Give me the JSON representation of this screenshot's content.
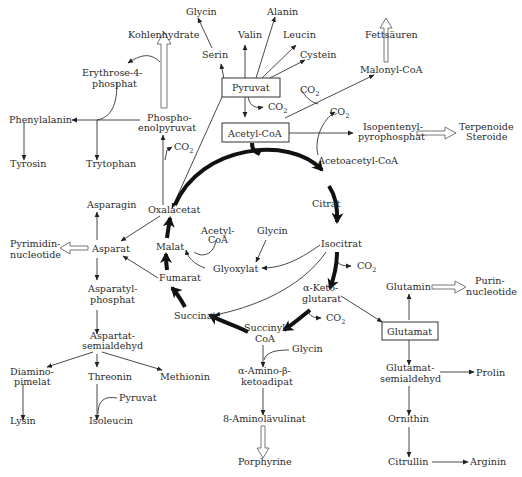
{
  "diagram": {
    "type": "metabolic-pathway",
    "language": "de",
    "cycle_name": "Citratzyklus (unlabeled)",
    "boxed_nodes": [
      "Pyruvat",
      "Acetyl-CoA",
      "Glutamat"
    ],
    "nodes": {
      "glycin_top": "Glycin",
      "alanin": "Alanin",
      "valin": "Valin",
      "leucin": "Leucin",
      "serin": "Serin",
      "cystein": "Cystein",
      "fettsaeuren": "Fettsäuren",
      "kohlenhydrate": "Kohlenhydrate",
      "erythrose_1": "Erythrose-4-",
      "erythrose_2": "phosphat",
      "pyruvat": "Pyruvat",
      "malonyl_coa": "Malonyl-CoA",
      "co2_pyruvat": "CO",
      "co2_malonyl": "CO",
      "co2_isopent": "CO",
      "phenylalanin": "Phenylalanin",
      "pep_1": "Phospho-",
      "pep_2": "enolpyruvat",
      "acetyl_coa": "Acetyl-CoA",
      "isopentenyl_1": "Isopentenyl-",
      "isopentenyl_2": "pyrophosphat",
      "terpenoide": "Terpenoide",
      "steroide": "Steroide",
      "co2_pep": "CO",
      "tyrosin": "Tyrosin",
      "trytophan": "Trytophan",
      "acetoacetyl_coa": "Acetoacetyl-CoA",
      "asparagin": "Asparagin",
      "oxalacetat": "Oxalacetat",
      "citrat": "Citrat",
      "acetyl_coa_gly_1": "Acetyl-",
      "acetyl_coa_gly_2": "CoA",
      "glycin_mid": "Glycin",
      "pyrimidin_1": "Pyrimidin-",
      "pyrimidin_2": "nucleotide",
      "asparat": "Asparat",
      "malat": "Malat",
      "isocitrat": "Isocitrat",
      "glyoxylat": "Glyoxylat",
      "co2_isocitrat": "CO",
      "fumarat": "Fumarat",
      "asparatyl_1": "Asparatyl-",
      "asparatyl_2": "phosphat",
      "aketo_1": "α-Keto-",
      "aketo_2": "glutarat",
      "glutamin": "Glutamin",
      "purin_1": "Purin-",
      "purin_2": "nucleotide",
      "succinat": "Succinat",
      "co2_aketo": "CO",
      "succinyl_1": "Succinyl-",
      "succinyl_2": "CoA",
      "glutamat": "Glutamat",
      "aspartat_semi_1": "Aspartat-",
      "aspartat_semi_2": "semialdehyd",
      "glycin_low": "Glycin",
      "amino_keto_1": "α-Amino-β-",
      "amino_keto_2": "ketoadipat",
      "glutamat_semi_1": "Glutamat-",
      "glutamat_semi_2": "semialdehyd",
      "prolin": "Prolin",
      "diamino_1": "Diamino-",
      "diamino_2": "pimelat",
      "threonin": "Threonin",
      "methionin": "Methionin",
      "pyruvat_small": "Pyruvat",
      "aminolaevulinat": "8-Aminolävulinat",
      "ornithin": "Ornithin",
      "lysin": "Lysin",
      "isoleucin": "Isoleucin",
      "porphyrine": "Porphyrine",
      "citrullin": "Citrullin",
      "arginin": "Arginin"
    },
    "co2_subscript": "2",
    "colors": {
      "text": "#2b2b2b",
      "line": "#333333",
      "cycle": "#111111",
      "hollow_arrow": "#666666",
      "background": "#ffffff"
    }
  }
}
